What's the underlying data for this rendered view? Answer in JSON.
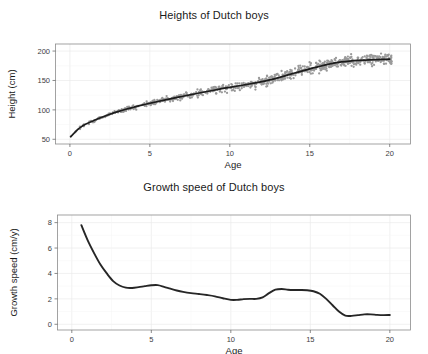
{
  "figure": {
    "width": 428,
    "height": 351,
    "background": "#ffffff",
    "point_color": "#9a9a9a",
    "line_color": "#1c1c1c",
    "panel_border_color": "#8c8c8c",
    "grid_color": "#ebebeb"
  },
  "chart_data": [
    {
      "type": "scatter",
      "id": "heights",
      "title": "Heights of Dutch boys",
      "xlabel": "Age",
      "ylabel": "Height (cm)",
      "xlim": [
        -0.9,
        21.3
      ],
      "ylim": [
        42,
        212
      ],
      "xticks": [
        0,
        5,
        10,
        15,
        20
      ],
      "yticks": [
        50,
        100,
        150,
        200
      ],
      "xtick_labels": [
        "0",
        "5",
        "10",
        "15",
        "20"
      ],
      "ytick_labels": [
        "50",
        "100",
        "150",
        "200"
      ],
      "grid": true,
      "legend": "none",
      "series": [
        {
          "name": "Fitted growth curve",
          "type": "line",
          "x": [
            0.05,
            0.25,
            0.5,
            0.75,
            1.0,
            1.5,
            2.0,
            2.5,
            3.0,
            3.5,
            4.0,
            4.5,
            5.0,
            5.5,
            6.0,
            6.5,
            7.0,
            7.5,
            8.0,
            8.5,
            9.0,
            9.5,
            10.0,
            10.5,
            11.0,
            11.5,
            12.0,
            12.5,
            13.0,
            13.5,
            14.0,
            14.5,
            15.0,
            15.5,
            16.0,
            16.5,
            17.0,
            17.5,
            18.0,
            18.5,
            19.0,
            19.5,
            20.0
          ],
          "y": [
            54.5,
            60.0,
            67.0,
            72.0,
            76.0,
            82.0,
            87.5,
            92.5,
            97.0,
            101.0,
            104.5,
            108.0,
            111.2,
            114.2,
            117.2,
            120.0,
            122.8,
            125.5,
            128.2,
            130.8,
            133.4,
            136.0,
            138.4,
            140.6,
            143.0,
            145.4,
            148.0,
            151.0,
            154.5,
            158.3,
            162.2,
            166.0,
            169.8,
            173.2,
            176.5,
            179.4,
            181.6,
            183.0,
            184.0,
            184.7,
            185.3,
            185.8,
            186.3
          ]
        },
        {
          "name": "Observed boys",
          "type": "points",
          "point_count": 745,
          "description": "Gray measurement points scattered tightly around the fitted curve; spread widens from about +/-2 cm in infancy to about +/-10 cm after age 10."
        }
      ]
    },
    {
      "type": "line",
      "id": "growth-speed",
      "title": "Growth speed of Dutch boys",
      "xlabel": "Age",
      "ylabel": "Growth speed (cm/y)",
      "xlim": [
        -0.9,
        21.3
      ],
      "ylim": [
        -0.45,
        8.6
      ],
      "xticks": [
        0,
        5,
        10,
        15,
        20
      ],
      "yticks": [
        0,
        2,
        4,
        6,
        8
      ],
      "xtick_labels": [
        "0",
        "5",
        "10",
        "15",
        "20"
      ],
      "ytick_labels": [
        "0",
        "2",
        "4",
        "6",
        "8"
      ],
      "grid": true,
      "legend": "none",
      "series": [
        {
          "name": "Growth speed",
          "x": [
            0.6,
            1.0,
            1.4,
            1.8,
            2.2,
            2.6,
            3.0,
            3.4,
            3.8,
            4.2,
            4.6,
            5.0,
            5.4,
            5.8,
            6.2,
            6.6,
            7.0,
            7.5,
            8.0,
            8.5,
            9.0,
            9.5,
            10.0,
            10.4,
            10.8,
            11.2,
            11.6,
            12.0,
            12.4,
            12.8,
            13.2,
            13.6,
            14.0,
            14.4,
            14.8,
            15.2,
            15.6,
            16.0,
            16.4,
            16.8,
            17.2,
            17.6,
            18.0,
            18.4,
            18.8,
            19.2,
            19.6,
            20.0
          ],
          "y": [
            7.8,
            6.6,
            5.6,
            4.7,
            4.0,
            3.4,
            3.05,
            2.88,
            2.86,
            2.92,
            3.0,
            3.07,
            3.08,
            2.95,
            2.8,
            2.66,
            2.55,
            2.45,
            2.38,
            2.3,
            2.2,
            2.05,
            1.92,
            1.92,
            1.98,
            2.0,
            2.0,
            2.12,
            2.45,
            2.72,
            2.78,
            2.72,
            2.7,
            2.7,
            2.68,
            2.6,
            2.4,
            2.0,
            1.5,
            1.0,
            0.68,
            0.66,
            0.72,
            0.78,
            0.78,
            0.74,
            0.72,
            0.73
          ]
        }
      ]
    }
  ]
}
